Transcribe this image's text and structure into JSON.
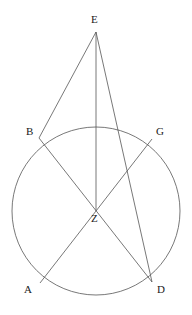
{
  "figure": {
    "canvas": {
      "width": 192,
      "height": 315
    },
    "stroke_color": "#555555",
    "label_color": "#1a1a1a",
    "background_color": "#ffffff",
    "stroke_width": 0.8
  },
  "circle": {
    "name": "main-circle",
    "center_x": 96,
    "center_y": 211,
    "radius": 84
  },
  "points": [
    {
      "id": "E",
      "label": "E",
      "x": 96,
      "y": 32,
      "label_x": 91,
      "label_y": 14,
      "on_circle": false
    },
    {
      "id": "B",
      "label": "B",
      "x": 39,
      "y": 138,
      "label_x": 26,
      "label_y": 126,
      "on_circle": true
    },
    {
      "id": "G",
      "label": "G",
      "x": 152,
      "y": 139,
      "label_x": 156,
      "label_y": 126,
      "on_circle": true
    },
    {
      "id": "Z",
      "label": "Z",
      "x": 96,
      "y": 211,
      "label_x": 91,
      "label_y": 213,
      "on_circle": false
    },
    {
      "id": "A",
      "label": "A",
      "x": 40,
      "y": 283,
      "label_x": 24,
      "label_y": 284,
      "on_circle": true
    },
    {
      "id": "D",
      "label": "D",
      "x": 152,
      "y": 282,
      "label_x": 157,
      "label_y": 284,
      "on_circle": true
    }
  ],
  "segments": [
    {
      "name": "segment-E-B",
      "from": "E",
      "to": "B",
      "x1": 96,
      "y1": 32,
      "x2": 39,
      "y2": 138
    },
    {
      "name": "segment-E-Z",
      "from": "E",
      "to": "Z",
      "x1": 96,
      "y1": 32,
      "x2": 96,
      "y2": 211
    },
    {
      "name": "segment-E-D",
      "from": "E",
      "to": "D",
      "x1": 96,
      "y1": 32,
      "x2": 152,
      "y2": 282
    },
    {
      "name": "segment-B-D",
      "from": "B",
      "to": "D",
      "x1": 39,
      "y1": 138,
      "x2": 152,
      "y2": 282
    },
    {
      "name": "segment-G-A",
      "from": "G",
      "to": "A",
      "x1": 152,
      "y1": 139,
      "x2": 40,
      "y2": 283
    }
  ]
}
